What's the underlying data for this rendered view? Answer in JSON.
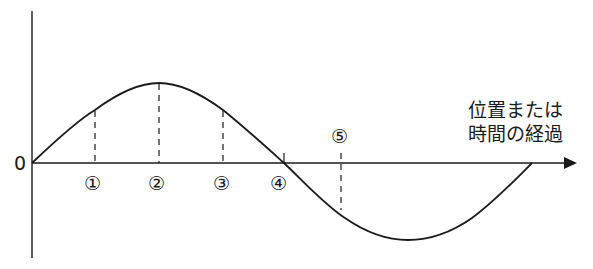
{
  "diagram": {
    "type": "wave-graph",
    "origin_label": "0",
    "x_axis_label_line1": "位置または",
    "x_axis_label_line2": "時間の経過",
    "markers": [
      {
        "id": "m1",
        "label": "①",
        "x": 95
      },
      {
        "id": "m2",
        "label": "②",
        "x": 159
      },
      {
        "id": "m3",
        "label": "③",
        "x": 223
      },
      {
        "id": "m4",
        "label": "④",
        "x": 284
      },
      {
        "id": "m5",
        "label": "⑤",
        "x": 341
      }
    ],
    "colors": {
      "line": "#1a1a1a",
      "background": "#ffffff"
    }
  }
}
